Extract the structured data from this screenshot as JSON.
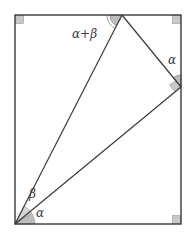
{
  "diagram": {
    "colors": {
      "line": "#3a3a3a",
      "angle_fill": "#bdbdbd",
      "angle_stroke": "#8a8a8a",
      "background": "#ffffff"
    },
    "rectangle": {
      "left": 15,
      "top": 15,
      "right": 181,
      "bottom": 224
    },
    "points": {
      "O": {
        "x": 15,
        "y": 224
      },
      "P": {
        "x": 122,
        "y": 15
      },
      "Q": {
        "x": 181,
        "y": 87
      }
    },
    "labels": {
      "top_angle": "α+β",
      "right_angle_label": "α",
      "bottom_beta": "β",
      "bottom_alpha": "α"
    },
    "right_angle_markers": [
      "top-left corner",
      "top-right corner",
      "bottom-right corner",
      "vertex Q"
    ]
  }
}
